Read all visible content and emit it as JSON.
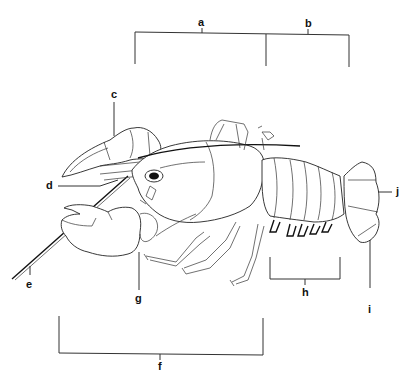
{
  "diagram": {
    "labels": [
      {
        "id": "a",
        "text": "a",
        "target": "cephalothorax bracket"
      },
      {
        "id": "b",
        "text": "b",
        "target": "abdomen bracket"
      },
      {
        "id": "c",
        "text": "c",
        "target": "cheliped / claw"
      },
      {
        "id": "d",
        "text": "d",
        "target": "antennule"
      },
      {
        "id": "e",
        "text": "e",
        "target": "antenna"
      },
      {
        "id": "f",
        "text": "f",
        "target": "walking legs bracket"
      },
      {
        "id": "g",
        "text": "g",
        "target": "mouthparts"
      },
      {
        "id": "h",
        "text": "h",
        "target": "swimmerets bracket"
      },
      {
        "id": "i",
        "text": "i",
        "target": "uropod"
      },
      {
        "id": "j",
        "text": "j",
        "target": "telson"
      }
    ],
    "colors": {
      "line": "#222222",
      "background": "#ffffff"
    }
  }
}
